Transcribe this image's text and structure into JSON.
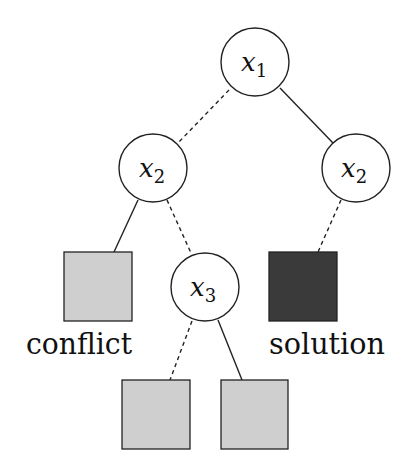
{
  "diagram": {
    "type": "search-tree",
    "colors": {
      "stroke": "#222222",
      "leaf_fill": "#cfcfcf",
      "solution_fill": "#3a3a3a",
      "background": "#ffffff"
    },
    "nodes": [
      {
        "id": "n1",
        "var": "x",
        "sub": "1"
      },
      {
        "id": "n2l",
        "var": "x",
        "sub": "2"
      },
      {
        "id": "n2r",
        "var": "x",
        "sub": "2"
      },
      {
        "id": "n3",
        "var": "x",
        "sub": "3"
      }
    ],
    "leaves": [
      {
        "id": "leaf-conflict",
        "label": "conflict"
      },
      {
        "id": "leaf-solution",
        "label": "solution"
      },
      {
        "id": "leaf-bottom-left",
        "label": ""
      },
      {
        "id": "leaf-bottom-right",
        "label": ""
      }
    ],
    "edges": [
      {
        "from": "n1",
        "to": "n2l",
        "style": "dashed"
      },
      {
        "from": "n1",
        "to": "n2r",
        "style": "solid"
      },
      {
        "from": "n2l",
        "to": "leaf-conflict",
        "style": "solid"
      },
      {
        "from": "n2l",
        "to": "n3",
        "style": "dashed"
      },
      {
        "from": "n2r",
        "to": "leaf-solution",
        "style": "dashed"
      },
      {
        "from": "n3",
        "to": "leaf-bottom-left",
        "style": "dashed"
      },
      {
        "from": "n3",
        "to": "leaf-bottom-right",
        "style": "solid"
      }
    ]
  }
}
